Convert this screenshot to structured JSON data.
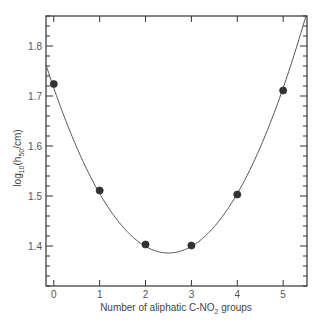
{
  "chart_data": {
    "type": "scatter",
    "title": "",
    "xlabel": "Number of aliphatic C-NO2 groups",
    "xlabel_parts": {
      "pre": "Number of aliphatic C-NO",
      "sub": "2",
      "post": " groups"
    },
    "ylabel": "log10(h50/cm)",
    "ylabel_parts": {
      "pre": "log",
      "sub1": "10",
      "mid": "(h",
      "sub2": "50",
      "post": "/cm)"
    },
    "xlim": [
      -0.17,
      5.52
    ],
    "ylim": [
      1.32,
      1.86
    ],
    "x_ticks": [
      0,
      1,
      2,
      3,
      4,
      5
    ],
    "x_tick_labels": [
      "0",
      "1",
      "2",
      "3",
      "4",
      "5"
    ],
    "y_ticks": [
      1.4,
      1.5,
      1.6,
      1.7,
      1.8
    ],
    "y_tick_labels": [
      "1.4",
      "1.5",
      "1.6",
      "1.7",
      "1.8"
    ],
    "y_minor_step": 0.02,
    "grid": false,
    "legend": null,
    "series": [
      {
        "name": "measured",
        "kind": "points",
        "x": [
          0,
          1,
          2,
          3,
          4,
          5
        ],
        "y": [
          1.724,
          1.511,
          1.403,
          1.401,
          1.503,
          1.711
        ],
        "color": "#333333"
      },
      {
        "name": "quadratic fit",
        "kind": "line",
        "formula": "0.0528*(x-2.5)^2 + 1.386",
        "coefficients": {
          "a": 0.0528,
          "h": 2.5,
          "c": 1.386
        },
        "color": "#555555"
      }
    ]
  },
  "colors": {
    "axis": "#333333",
    "marker": "#333333",
    "curve": "#555555"
  }
}
